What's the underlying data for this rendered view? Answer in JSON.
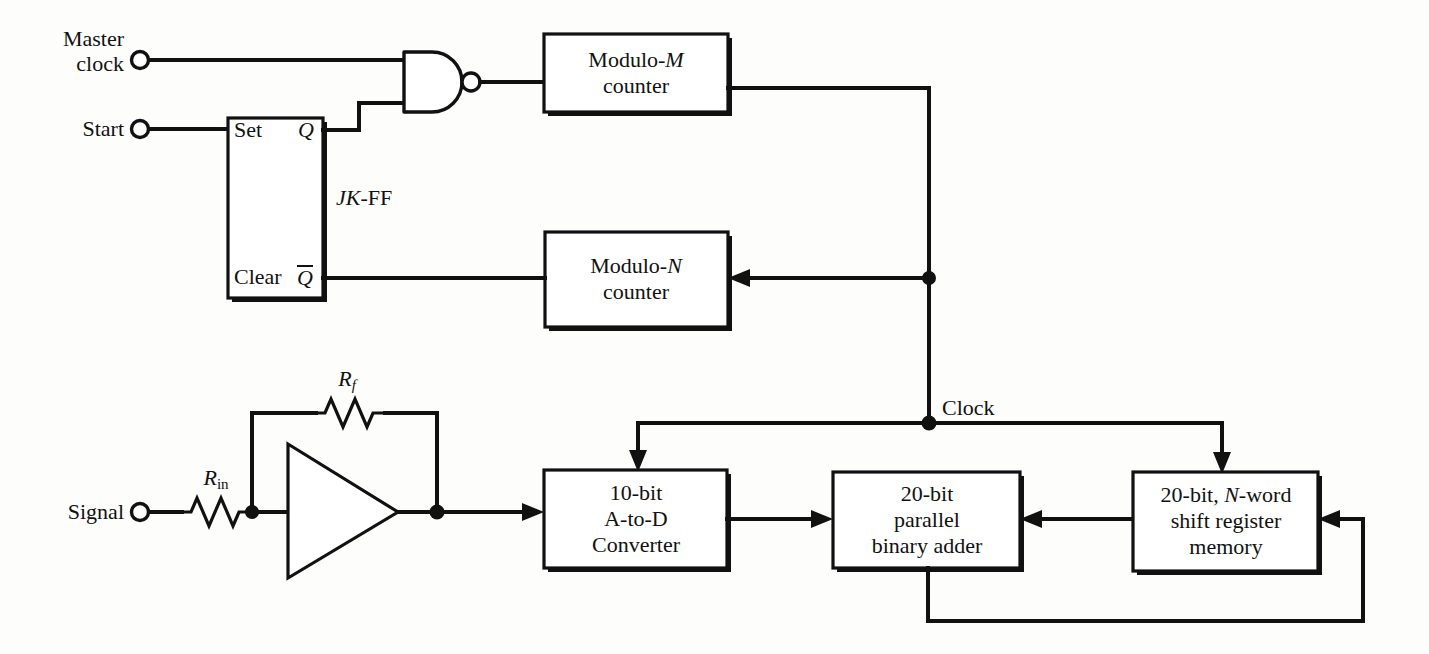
{
  "figure": {
    "kind": "digital-signal-averager-block-diagram",
    "background_color": "#fdfdfb",
    "line_color": "#111111"
  },
  "inputs": [
    {
      "id": "master-clock",
      "label_line1": "Master",
      "label_line2": "clock"
    },
    {
      "id": "start",
      "label": "Start"
    },
    {
      "id": "signal",
      "label": "Signal"
    }
  ],
  "components": {
    "nand_gate": {
      "type": "NAND",
      "inputs": 2,
      "bubble": true
    },
    "jk_flipflop": {
      "name": "JK-FF",
      "name_italic_part": "JK",
      "name_plain_part": "-FF",
      "pins": {
        "set": "Set",
        "clear": "Clear",
        "q": "Q",
        "qbar": "Q",
        "qbar_overline": true
      }
    },
    "modulo_m_counter": {
      "line1_prefix": "Modulo-",
      "line1_italic": "M",
      "line2": "counter"
    },
    "modulo_n_counter": {
      "line1_prefix": "Modulo-",
      "line1_italic": "N",
      "line2": "counter"
    },
    "adc": {
      "line1": "10-bit",
      "line2": "A-to-D",
      "line3": "Converter"
    },
    "adder": {
      "line1": "20-bit",
      "line2": "parallel",
      "line3": "binary adder"
    },
    "shift_register": {
      "line1_prefix": "20-bit, ",
      "line1_italic": "N",
      "line1_suffix": "-word",
      "line2": "shift register",
      "line3": "memory"
    },
    "op_amp": {
      "type": "inverting-amplifier"
    },
    "resistor_feedback": {
      "label_base": "R",
      "label_sub": "f",
      "sub_italic": true
    },
    "resistor_input": {
      "label_base": "R",
      "label_sub": "in",
      "sub_italic": false
    }
  },
  "annotations": [
    {
      "id": "clock-label",
      "text": "Clock"
    }
  ]
}
